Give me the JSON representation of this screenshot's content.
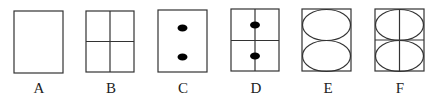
{
  "figures": [
    {
      "label": "A",
      "description": "empty rectangle"
    },
    {
      "label": "B",
      "description": "rectangle divided into four quadrants"
    },
    {
      "label": "C",
      "description": "rectangle with two black dots stacked vertically"
    },
    {
      "label": "D",
      "description": "quadrant rectangle with two black dots on vertical line"
    },
    {
      "label": "E",
      "description": "rectangle with two stacked ellipses"
    },
    {
      "label": "F",
      "description": "quadrant rectangle with two stacked ellipses"
    }
  ],
  "colors": {
    "stroke": "#333333",
    "fill": "#000000",
    "background": "#ffffff"
  }
}
